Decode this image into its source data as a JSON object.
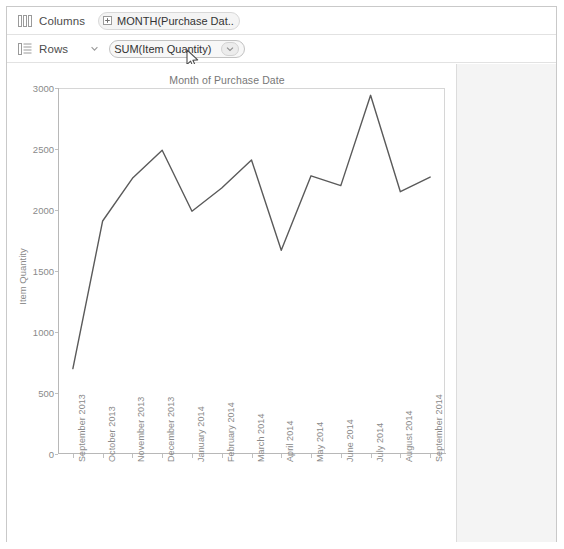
{
  "window": {
    "background": "#ffffff",
    "border_color": "#c9c9c9"
  },
  "shelves": {
    "columns": {
      "icon": "columns-grid-icon",
      "label": "Columns",
      "pill": {
        "icon": "plus-expand-icon",
        "text": "MONTH(Purchase Dat..",
        "type": "dimension"
      }
    },
    "rows": {
      "icon": "rows-list-icon",
      "label": "Rows",
      "caret_icon": "chevron-down-icon",
      "pill": {
        "text": "SUM(Item Quantity)",
        "type": "measure",
        "dropdown_icon": "chevron-down-icon"
      }
    }
  },
  "cursor": {
    "icon": "mouse-pointer-icon",
    "x": 186,
    "y": 49
  },
  "colors": {
    "line": "#5a5a5a",
    "axis": "#b8b8b8",
    "text": "#8a8a8a",
    "plot_border": "#d6d6d6",
    "outside_panel": "#ebebeb"
  },
  "chart_data": {
    "type": "line",
    "title": "Month of Purchase Date",
    "xlabel": "",
    "ylabel": "Item Quantity",
    "ylim": [
      0,
      3000
    ],
    "yticks": [
      0,
      500,
      1000,
      1500,
      2000,
      2500,
      3000
    ],
    "ytick_labels": [
      "0",
      "500",
      "1000",
      "1500",
      "2000",
      "2500",
      "3000"
    ],
    "grid": false,
    "legend": "none",
    "categories": [
      "September 2013",
      "October 2013",
      "November 2013",
      "December 2013",
      "January 2014",
      "February 2014",
      "March 2014",
      "April 2014",
      "May 2014",
      "June 2014",
      "July 2014",
      "August 2014",
      "September 2014"
    ],
    "series": [
      {
        "name": "SUM(Item Quantity)",
        "values": [
          700,
          1910,
          2260,
          2490,
          1990,
          2180,
          2410,
          1670,
          2280,
          2200,
          2940,
          2150,
          2270
        ]
      }
    ]
  }
}
